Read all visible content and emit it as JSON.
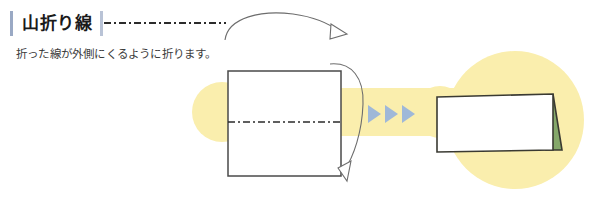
{
  "page": {
    "background_color": "#ffffff",
    "width": 597,
    "height": 198
  },
  "header": {
    "title": "山折り線",
    "accent_bar_color": "#9aa9c4",
    "legend_line_style": "dash-dot",
    "legend_line_color": "#2b2b2b"
  },
  "description": {
    "text": "折った線が外側にくるように折ります。"
  },
  "diagram": {
    "highlight_color": "#faeead",
    "before": {
      "label": "flat-square-sheet",
      "fill": "#ffffff",
      "stroke": "#4a4a4a",
      "fold_line_label": "mountain-fold-line",
      "fold_line_color": "#2b2b2b",
      "fold_line_style": "dash-dot"
    },
    "fold_arrow": {
      "label": "fold-direction-arrow",
      "color": "#6d6d6d",
      "direction": "top-to-bottom-over-right-edge"
    },
    "pointer_arrow": {
      "label": "lead-in-arrow",
      "color": "#6d6d6d",
      "direction": "right-down"
    },
    "progress_chevrons": {
      "count": 3,
      "color": "#9fb8d8",
      "direction": "right"
    },
    "after": {
      "label": "folded-tent-card",
      "front_fill": "#ffffff",
      "back_flap_fill": "#85a86a",
      "stroke": "#3a3a32"
    }
  }
}
